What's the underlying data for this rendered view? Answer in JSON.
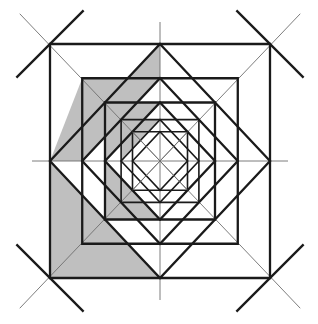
{
  "figure": {
    "title": "Nested squares and diamonds geometric construction",
    "type": "geometric-diagram",
    "canvas": {
      "width": 318,
      "height": 324,
      "background_color": "#ffffff"
    },
    "colors": {
      "stroke_bold": "#1a1a1a",
      "stroke_thin": "#6e6e6e",
      "shade_fill": "#bfbfbf",
      "background": "#ffffff"
    },
    "strokes": {
      "bold_width": 2.3,
      "thin_width": 0.9,
      "medium_width": 1.6
    },
    "construction": {
      "center_x": 160,
      "center_y": 161,
      "outer_square": {
        "left": 50,
        "top": 44,
        "right": 270,
        "bottom": 278,
        "half_width": 110,
        "half_height": 117
      },
      "levels": 5,
      "scale_factor": 0.7071,
      "rotation_step_degrees": 45,
      "diagonal_overshoot": 42,
      "corner_x_marks": 4,
      "description": "Alternating axis-aligned squares and 45-degree rotated diamonds, each inscribed in the previous, repeating self-similarly toward the center. Main diagonals and mid-lines of the outer square extend past its edges forming X crossings at the four corners."
    },
    "shading": {
      "fill_color": "#bfbfbf",
      "quadrant": "lower-left",
      "shape": "self-similar pinwheel wedge",
      "levels_shaded": 4,
      "description": "A gray pinwheel-shaped region occupies the lower-left of each nesting level, bounded by the square edge, the diamond edge and the main diagonal."
    },
    "geometry_notes": {
      "axis_lines": [
        "vertical-midline",
        "horizontal-midline"
      ],
      "diagonal_lines": [
        "main-diagonal-nw-se",
        "main-diagonal-ne-sw"
      ],
      "symmetry": "4-fold rotational outline with 1-fold shading"
    }
  }
}
